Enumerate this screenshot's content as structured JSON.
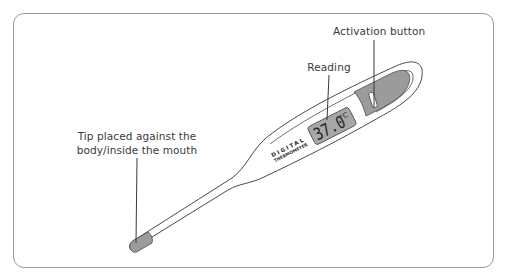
{
  "diagram": {
    "subject": "digital thermometer",
    "labels": {
      "activation_button": "Activation button",
      "reading": "Reading",
      "tip_line1": "Tip placed against the",
      "tip_line2": "body/inside the mouth"
    },
    "device_text": {
      "brand_line1": "DIGITAL",
      "brand_line2": "THERMOMETER"
    },
    "display": {
      "value": "37.0",
      "unit": "°C"
    },
    "colors": {
      "outline": "#4a4a4a",
      "frame": "#9a9a9a",
      "fill_gray": "#9b9b9b",
      "display_bg": "#a7a7a7",
      "body": "#ffffff",
      "text": "#3a3a3a"
    }
  }
}
